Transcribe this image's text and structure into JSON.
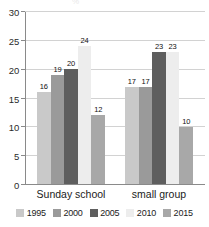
{
  "chart_data": {
    "type": "bar",
    "title": "",
    "xlabel": "",
    "ylabel": "",
    "ylim": [
      0,
      30
    ],
    "yticks": [
      0,
      5,
      10,
      15,
      20,
      25,
      30
    ],
    "grid": true,
    "legend_position": "bottom",
    "categories": [
      "Sunday school",
      "small group"
    ],
    "series": [
      {
        "name": "1995",
        "color": "#c9c9c9",
        "values": [
          16,
          17
        ]
      },
      {
        "name": "2000",
        "color": "#9a9a9a",
        "values": [
          19,
          17
        ]
      },
      {
        "name": "2005",
        "color": "#5e5e5e",
        "values": [
          20,
          23
        ]
      },
      {
        "name": "2010",
        "color": "#ededed",
        "values": [
          24,
          23
        ]
      },
      {
        "name": "2015",
        "color": "#a8a8a8",
        "values": [
          12,
          10
        ]
      }
    ]
  },
  "axis": {
    "y_tick_labels": [
      "0",
      "5",
      "10",
      "15",
      "20",
      "25",
      "30"
    ]
  },
  "bar_labels": {
    "group0": [
      "16",
      "19",
      "20",
      "24",
      "12"
    ],
    "group1": [
      "17",
      "17",
      "23",
      "23",
      "10"
    ]
  },
  "legend": {
    "items": [
      {
        "label": "1995",
        "color": "#c9c9c9"
      },
      {
        "label": "2000",
        "color": "#9a9a9a"
      },
      {
        "label": "2005",
        "color": "#5e5e5e"
      },
      {
        "label": "2010",
        "color": "#ededed"
      },
      {
        "label": "2015",
        "color": "#a8a8a8"
      }
    ]
  },
  "categories": {
    "group0": "Sunday school",
    "group1": "small group"
  },
  "title_remnant": "%"
}
